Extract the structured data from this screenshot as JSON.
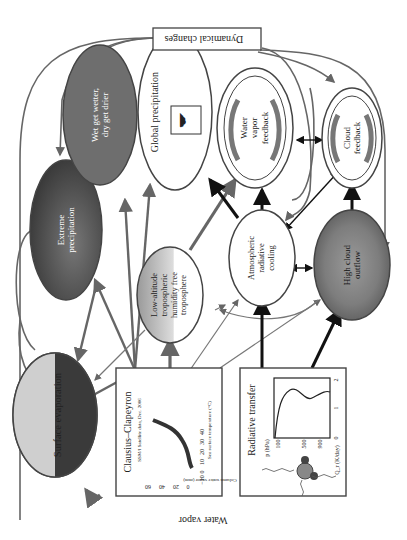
{
  "title_bottom": "Water vapor",
  "top_box": "Dynamical changes",
  "nodes": {
    "surface_evaporation": "Surface evaporation",
    "extreme_precipitation": [
      "Extreme",
      "precipitation"
    ],
    "wet_get_wetter": [
      "Wet get wetter,",
      "dry get drier"
    ],
    "global_precipitation": "Global precipitation",
    "water_vapor_feedback": [
      "Water",
      "vapor",
      "feedback"
    ],
    "cloud_feedback": [
      "Cloud",
      "feedback"
    ],
    "low_altitude": [
      "Low-altitude",
      "tropospheric",
      "humidity free",
      "troposphere"
    ],
    "atmospheric_cooling": [
      "Atmospheric",
      "radiative",
      "cooling"
    ],
    "high_cloud_outflow": [
      "High cloud",
      "outflow"
    ]
  },
  "clausius_panel": {
    "title": "Clausius–Clapeyron",
    "subtitle": "SSM/I Satellite data, Dec. 2006",
    "ylabel": "Column water vapor (mm)",
    "xlabel": "Sea surface temperature (°C)",
    "yticks": [
      "0",
      "20",
      "40",
      "60"
    ],
    "xticks": [
      "−10",
      "0",
      "10",
      "20",
      "30",
      "40"
    ]
  },
  "radiative_panel": {
    "title": "Radiative transfer",
    "ylabel": "p (hPa)",
    "yticks": [
      "100",
      "500",
      "900"
    ],
    "xlabel": "Q_r (K/day)",
    "xticks": [
      "0",
      "1",
      "2"
    ]
  },
  "colors": {
    "line": "#555555",
    "arrow_dark": "#111111",
    "evap_dark": "#3a3a3a",
    "extreme_fill": "#4a4a4a",
    "wet_fill": "#6e6e6e"
  }
}
